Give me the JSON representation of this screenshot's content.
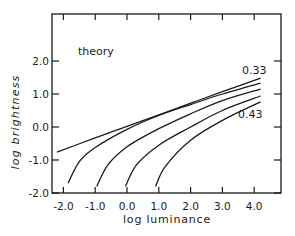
{
  "chart_data": {
    "type": "line",
    "title": "",
    "annotation": "theory",
    "xlabel": "log luminance",
    "ylabel": "log brightness",
    "xlim": [
      -2.4,
      4.8
    ],
    "ylim": [
      -2.0,
      3.4
    ],
    "x_ticks": [
      -2.0,
      -1.0,
      0.0,
      1.0,
      2.0,
      3.0,
      4.0
    ],
    "x_tick_labels": [
      "-2.0",
      "-1.0",
      "0.0",
      "1.0",
      "2.0",
      "3.0",
      "4.0"
    ],
    "y_ticks": [
      -2.0,
      -1.0,
      0.0,
      1.0,
      2.0
    ],
    "y_tick_labels": [
      "-2.0",
      "-1.0",
      "0.0",
      "1.0",
      "2.0"
    ],
    "grid": false,
    "legend": "none (inline curve labels)",
    "series": [
      {
        "name": "0.33",
        "label_visible": true,
        "points": [
          [
            -2.2,
            -0.76
          ],
          [
            -1.0,
            -0.33
          ],
          [
            0.0,
            0.02
          ],
          [
            1.0,
            0.37
          ],
          [
            2.0,
            0.72
          ],
          [
            3.0,
            1.07
          ],
          [
            4.2,
            1.48
          ]
        ]
      },
      {
        "name": "curve-2",
        "label_visible": false,
        "points": [
          [
            -1.85,
            -1.7
          ],
          [
            -1.5,
            -1.05
          ],
          [
            -1.0,
            -0.62
          ],
          [
            0.0,
            -0.07
          ],
          [
            1.0,
            0.35
          ],
          [
            2.0,
            0.68
          ],
          [
            3.0,
            1.0
          ],
          [
            4.2,
            1.33
          ]
        ]
      },
      {
        "name": "curve-3",
        "label_visible": false,
        "points": [
          [
            -0.95,
            -1.8
          ],
          [
            -0.6,
            -1.15
          ],
          [
            0.0,
            -0.6
          ],
          [
            1.0,
            -0.05
          ],
          [
            2.0,
            0.4
          ],
          [
            3.0,
            0.8
          ],
          [
            4.2,
            1.15
          ]
        ]
      },
      {
        "name": "curve-4",
        "label_visible": false,
        "points": [
          [
            -0.05,
            -1.8
          ],
          [
            0.3,
            -1.15
          ],
          [
            1.0,
            -0.55
          ],
          [
            2.0,
            0.0
          ],
          [
            3.0,
            0.5
          ],
          [
            4.2,
            0.94
          ]
        ]
      },
      {
        "name": "0.43",
        "label_visible": true,
        "points": [
          [
            0.9,
            -1.8
          ],
          [
            1.2,
            -1.2
          ],
          [
            2.0,
            -0.4
          ],
          [
            3.0,
            0.2
          ],
          [
            4.2,
            0.76
          ]
        ]
      }
    ]
  },
  "labels": {
    "annotation": "theory",
    "xlabel": "log luminance",
    "ylabel": "log brightness",
    "top_curve": "0.33",
    "bottom_curve": "0.43"
  },
  "style": {
    "line_color": "#1a1a1a",
    "background": "#ffffff"
  }
}
